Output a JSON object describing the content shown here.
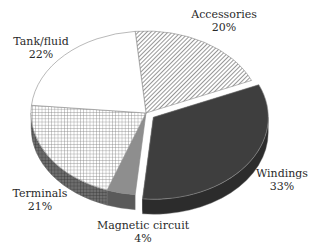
{
  "chart_data": {
    "type": "pie",
    "style": "3d-exploded",
    "title": "",
    "slices": [
      {
        "label": "Accessories",
        "value": 20,
        "display": "20%",
        "fill": "diag-hatch",
        "color": "#8a8a8a"
      },
      {
        "label": "Windings",
        "value": 33,
        "display": "33%",
        "fill": "solid",
        "color": "#3c3c3c",
        "exploded": true
      },
      {
        "label": "Magnetic circuit",
        "value": 4,
        "display": "4%",
        "fill": "solid",
        "color": "#8c8c8c"
      },
      {
        "label": "Terminals",
        "value": 21,
        "display": "21%",
        "fill": "grid-hatch",
        "color": "#9a9a9a"
      },
      {
        "label": "Tank/fluid",
        "value": 22,
        "display": "22%",
        "fill": "solid",
        "color": "#ffffff"
      }
    ],
    "legend": "none",
    "labels_position": "outside"
  },
  "labels": {
    "accessories": {
      "name": "Accessories",
      "pct": "20%"
    },
    "windings": {
      "name": "Windings",
      "pct": "33%"
    },
    "magnetic": {
      "name": "Magnetic circuit",
      "pct": "4%"
    },
    "terminals": {
      "name": "Terminals",
      "pct": "21%"
    },
    "tank": {
      "name": "Tank/fluid",
      "pct": "22%"
    }
  }
}
